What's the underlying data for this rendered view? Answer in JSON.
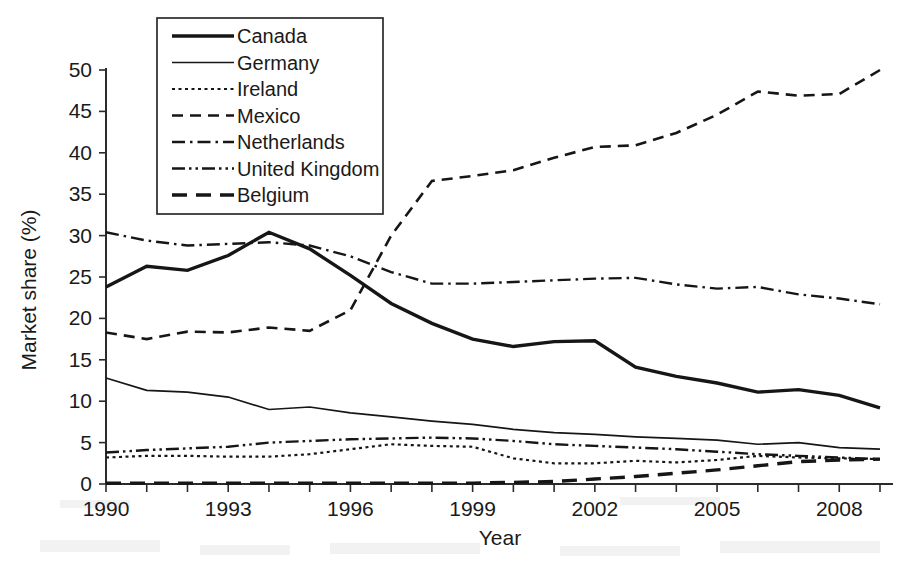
{
  "chart_data": {
    "type": "line",
    "title": "",
    "xlabel": "Year",
    "ylabel": "Market share (%)",
    "xlim": [
      1990,
      2009
    ],
    "ylim": [
      0,
      50
    ],
    "grid": false,
    "legend_position": "top-left-inside",
    "x": [
      1990,
      1991,
      1992,
      1993,
      1994,
      1995,
      1996,
      1997,
      1998,
      1999,
      2000,
      2001,
      2002,
      2003,
      2004,
      2005,
      2006,
      2007,
      2008,
      2009
    ],
    "xticks": [
      1990,
      1993,
      1996,
      1999,
      2002,
      2005,
      2008
    ],
    "xticklabels": [
      "1990",
      "1993",
      "1996",
      "1999",
      "2002",
      "2005",
      "2008"
    ],
    "yticks": [
      0,
      5,
      10,
      15,
      20,
      25,
      30,
      35,
      40,
      45,
      50
    ],
    "yticklabels": [
      "0",
      "5",
      "10",
      "15",
      "20",
      "25",
      "30",
      "35",
      "40",
      "45",
      "50"
    ],
    "series": [
      {
        "name": "Canada",
        "style": "solid-thick",
        "values": [
          23.8,
          26.3,
          25.8,
          27.6,
          30.4,
          28.4,
          25.2,
          21.8,
          19.4,
          17.5,
          16.6,
          17.2,
          17.3,
          14.1,
          13.0,
          12.2,
          11.1,
          11.4,
          10.7,
          9.2
        ]
      },
      {
        "name": "Germany",
        "style": "solid-thin",
        "values": [
          12.8,
          11.3,
          11.1,
          10.5,
          9.0,
          9.3,
          8.6,
          8.1,
          7.6,
          7.2,
          6.6,
          6.2,
          6.0,
          5.7,
          5.5,
          5.3,
          4.8,
          5.0,
          4.4,
          4.2
        ]
      },
      {
        "name": "Ireland",
        "style": "dotted",
        "values": [
          3.2,
          3.4,
          3.4,
          3.3,
          3.3,
          3.6,
          4.2,
          4.8,
          4.6,
          4.5,
          3.1,
          2.5,
          2.5,
          2.8,
          2.6,
          2.9,
          3.4,
          3.2,
          3.1,
          3.0
        ]
      },
      {
        "name": "Mexico",
        "style": "dashed",
        "values": [
          18.3,
          17.5,
          18.4,
          18.3,
          18.9,
          18.5,
          21.0,
          30.0,
          36.6,
          37.2,
          37.9,
          39.4,
          40.7,
          40.9,
          42.4,
          44.6,
          47.4,
          46.9,
          47.1,
          50.0
        ]
      },
      {
        "name": "Netherlands",
        "style": "dash-dot",
        "values": [
          30.4,
          29.4,
          28.8,
          29.0,
          29.2,
          28.8,
          27.5,
          25.6,
          24.2,
          24.2,
          24.4,
          24.6,
          24.8,
          24.9,
          24.1,
          23.6,
          23.8,
          22.9,
          22.4,
          21.7
        ]
      },
      {
        "name": "United Kingdom",
        "style": "dash-dot-dot",
        "values": [
          3.8,
          4.1,
          4.3,
          4.5,
          5.0,
          5.2,
          5.4,
          5.5,
          5.6,
          5.5,
          5.2,
          4.8,
          4.6,
          4.4,
          4.2,
          3.9,
          3.6,
          3.4,
          3.2,
          3.0
        ]
      },
      {
        "name": "Belgium",
        "style": "long-dash",
        "values": [
          0.1,
          0.1,
          0.1,
          0.1,
          0.1,
          0.1,
          0.1,
          0.1,
          0.1,
          0.1,
          0.2,
          0.3,
          0.6,
          0.9,
          1.3,
          1.7,
          2.2,
          2.7,
          2.9,
          3.0
        ]
      }
    ]
  },
  "legend": {
    "items": [
      {
        "label": "Canada",
        "style": "solid-thick"
      },
      {
        "label": "Germany",
        "style": "solid-thin"
      },
      {
        "label": "Ireland",
        "style": "dotted"
      },
      {
        "label": "Mexico",
        "style": "dashed"
      },
      {
        "label": "Netherlands",
        "style": "dash-dot"
      },
      {
        "label": "United Kingdom",
        "style": "dash-dot-dot"
      },
      {
        "label": "Belgium",
        "style": "long-dash"
      }
    ]
  },
  "colors": {
    "ink": "#161616",
    "axis": "#2b2b2b",
    "background": "#ffffff"
  }
}
